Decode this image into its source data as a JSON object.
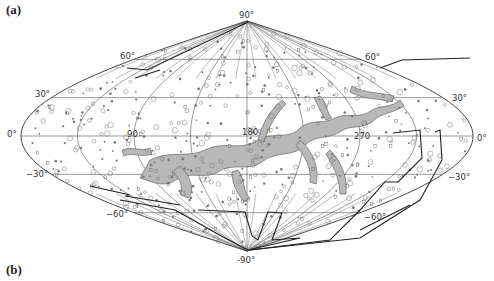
{
  "figure": {
    "panel_a_label": "(a)",
    "panel_b_label": "(b)",
    "projection": "sinusoidal (Sanson-Flamsteed) all-sky",
    "latitude_labels": {
      "north_pole": "90°",
      "south_pole": "-90°",
      "lat60_left": "60°",
      "lat60_right": "60°",
      "lat30_left": "30°",
      "lat30_right": "30°",
      "lat0_left": "0°",
      "lat0_right": "0°",
      "latm30_left": "−30°",
      "latm30_right": "−30°",
      "latm60_left": "−60°",
      "latm60_right": "−60°"
    },
    "longitude_labels": {
      "lon90": "90",
      "lon180": "180",
      "lon270": "270"
    },
    "colors": {
      "grid": "#555555",
      "outline": "#333333",
      "cloud_fill": "#b8b8b8",
      "cloud_stroke": "#555555",
      "survey_boundary": "#222222",
      "markers": "#777777"
    },
    "latitude_lines_deg": [
      -60,
      -30,
      0,
      30,
      60
    ],
    "meridian_offsets_deg": [
      -180,
      -135,
      -90,
      -45,
      0,
      45,
      90,
      135,
      180
    ]
  }
}
